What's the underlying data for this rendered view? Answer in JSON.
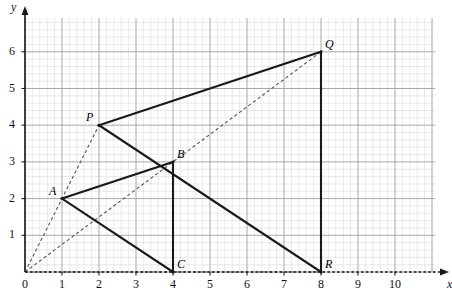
{
  "chart_data": {
    "type": "scatter",
    "title": "",
    "xlabel": "x",
    "ylabel": "y",
    "xlim": [
      0,
      11.1
    ],
    "ylim": [
      0,
      7.1
    ],
    "grid": true,
    "minor_grid_divisions": 5,
    "legend": "none",
    "x_ticks": [
      "0",
      "1",
      "2",
      "3",
      "4",
      "5",
      "6",
      "7",
      "8",
      "9",
      "10"
    ],
    "x_tick_values": [
      0,
      1,
      2,
      3,
      4,
      5,
      6,
      7,
      8,
      9,
      10
    ],
    "y_ticks": [
      "0",
      "1",
      "2",
      "3",
      "4",
      "5",
      "6"
    ],
    "y_tick_values": [
      0,
      1,
      2,
      3,
      4,
      5,
      6
    ],
    "points": [
      {
        "name": "A",
        "x": 1,
        "y": 2,
        "label": "A",
        "label_pos": "left"
      },
      {
        "name": "B",
        "x": 4,
        "y": 3,
        "label": "B",
        "label_pos": "right"
      },
      {
        "name": "C",
        "x": 4,
        "y": 0,
        "label": "C",
        "label_pos": "right"
      },
      {
        "name": "P",
        "x": 2,
        "y": 4,
        "label": "P",
        "label_pos": "left"
      },
      {
        "name": "Q",
        "x": 8,
        "y": 6,
        "label": "Q",
        "label_pos": "right"
      },
      {
        "name": "R",
        "x": 8,
        "y": 0,
        "label": "R",
        "label_pos": "right"
      }
    ],
    "solid_polygons": [
      {
        "name": "triangle-ABC",
        "vertices": [
          [
            1,
            2
          ],
          [
            4,
            3
          ],
          [
            4,
            0
          ]
        ]
      },
      {
        "name": "triangle-PQR",
        "vertices": [
          [
            2,
            4
          ],
          [
            8,
            6
          ],
          [
            8,
            0
          ]
        ]
      }
    ],
    "dashed_rays": [
      {
        "name": "ray-O-A-P",
        "from": [
          0,
          0
        ],
        "to": [
          2,
          4
        ]
      },
      {
        "name": "ray-O-B-Q",
        "from": [
          0,
          0
        ],
        "to": [
          8,
          6
        ]
      },
      {
        "name": "ray-O-C-R",
        "from": [
          0,
          0
        ],
        "to": [
          8,
          0
        ]
      }
    ],
    "colors": {
      "solid_line": "#1a1a1a",
      "dashed_line": "#555555",
      "axis": "#1a1a1a",
      "grid_major": "#9aa0a6",
      "grid_minor": "#d8dce0",
      "background": "#ffffff",
      "text": "#111111"
    },
    "geometry": {
      "origin_px": [
        25,
        272
      ],
      "unit_px_x": 37,
      "unit_px_y": 36.7,
      "grid_right_px": 435,
      "grid_top_px": 18
    }
  }
}
